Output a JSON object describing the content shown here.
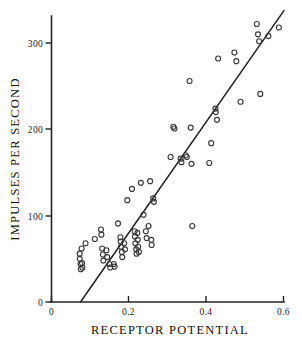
{
  "chart_data": {
    "type": "scatter",
    "title": "",
    "xlabel": "RECEPTOR POTENTIAL",
    "ylabel": "IMPULSES PER SECOND",
    "xlim": [
      0,
      0.6
    ],
    "ylim": [
      0,
      340
    ],
    "xticks": [
      0,
      0.2,
      0.4,
      0.6
    ],
    "xtick_labels": [
      "0",
      "0.2",
      "0.4",
      "0.6"
    ],
    "yticks": [
      0,
      100,
      200,
      300
    ],
    "ytick_labels": [
      "0",
      "100",
      "200",
      "300"
    ],
    "grid": false,
    "legend": null,
    "marker": "open-circle",
    "series": [
      {
        "name": "receptor potential vs firing rate",
        "points": [
          [
            0.073,
            56
          ],
          [
            0.073,
            50
          ],
          [
            0.075,
            44
          ],
          [
            0.076,
            38
          ],
          [
            0.078,
            62
          ],
          [
            0.079,
            45
          ],
          [
            0.08,
            40
          ],
          [
            0.088,
            68
          ],
          [
            0.112,
            73
          ],
          [
            0.128,
            84
          ],
          [
            0.129,
            78
          ],
          [
            0.131,
            62
          ],
          [
            0.133,
            55
          ],
          [
            0.134,
            48
          ],
          [
            0.142,
            60
          ],
          [
            0.144,
            52
          ],
          [
            0.15,
            44
          ],
          [
            0.152,
            40
          ],
          [
            0.161,
            44
          ],
          [
            0.163,
            41
          ],
          [
            0.172,
            91
          ],
          [
            0.178,
            75
          ],
          [
            0.179,
            70
          ],
          [
            0.18,
            64
          ],
          [
            0.182,
            58
          ],
          [
            0.183,
            52
          ],
          [
            0.188,
            68
          ],
          [
            0.19,
            61
          ],
          [
            0.196,
            118
          ],
          [
            0.208,
            131
          ],
          [
            0.215,
            82
          ],
          [
            0.216,
            76
          ],
          [
            0.217,
            68
          ],
          [
            0.219,
            61
          ],
          [
            0.22,
            56
          ],
          [
            0.222,
            80
          ],
          [
            0.223,
            72
          ],
          [
            0.224,
            64
          ],
          [
            0.226,
            58
          ],
          [
            0.231,
            138
          ],
          [
            0.238,
            101
          ],
          [
            0.244,
            82
          ],
          [
            0.246,
            74
          ],
          [
            0.251,
            88
          ],
          [
            0.255,
            140
          ],
          [
            0.258,
            72
          ],
          [
            0.259,
            66
          ],
          [
            0.263,
            120
          ],
          [
            0.265,
            116
          ],
          [
            0.308,
            168
          ],
          [
            0.315,
            203
          ],
          [
            0.318,
            201
          ],
          [
            0.334,
            166
          ],
          [
            0.336,
            162
          ],
          [
            0.347,
            170
          ],
          [
            0.35,
            168
          ],
          [
            0.357,
            256
          ],
          [
            0.36,
            202
          ],
          [
            0.362,
            160
          ],
          [
            0.364,
            88
          ],
          [
            0.408,
            161
          ],
          [
            0.413,
            184
          ],
          [
            0.424,
            224
          ],
          [
            0.425,
            220
          ],
          [
            0.428,
            211
          ],
          [
            0.431,
            282
          ],
          [
            0.473,
            289
          ],
          [
            0.478,
            279
          ],
          [
            0.489,
            232
          ],
          [
            0.531,
            322
          ],
          [
            0.534,
            310
          ],
          [
            0.537,
            302
          ],
          [
            0.54,
            241
          ],
          [
            0.561,
            308
          ],
          [
            0.588,
            318
          ]
        ]
      }
    ],
    "fit_line": {
      "label": "regression line",
      "x_start": 0.075,
      "y_start": 0,
      "x_end": 0.602,
      "y_end": 338
    }
  }
}
